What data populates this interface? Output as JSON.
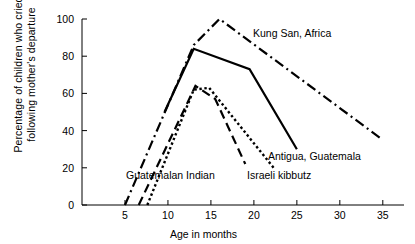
{
  "chart_data": {
    "type": "line",
    "title": "",
    "xlabel": "Age in months",
    "ylabel": "Percentage of children who cried following mother's departure",
    "ylabel_line1": "Percentage of children who cried",
    "ylabel_line2": "following mother's departure",
    "xlim": [
      0,
      37
    ],
    "ylim": [
      0,
      100
    ],
    "xticks": [
      5,
      10,
      15,
      20,
      25,
      30,
      35
    ],
    "yticks": [
      0,
      20,
      40,
      60,
      80,
      100
    ],
    "grid": false,
    "legend_position": "inline-annotations",
    "line_color": "#000000",
    "series": [
      {
        "name": "Kung San, Africa",
        "style": "dash-dot",
        "label_x": 27.0,
        "label_y": 95,
        "x": [
          5,
          13,
          16,
          35
        ],
        "y": [
          0,
          86,
          100,
          35
        ]
      },
      {
        "name": "Antigua, Guatemala",
        "style": "solid",
        "label_x": 28.5,
        "label_y": 30,
        "x": [
          9.6,
          13,
          19.5,
          25
        ],
        "y": [
          50,
          84,
          73,
          30
        ]
      },
      {
        "name": "Guatemalan Indian",
        "style": "dashed",
        "label_x": 12.5,
        "label_y": 18,
        "x": [
          6.6,
          13.2,
          15.5,
          19.0
        ],
        "y": [
          0,
          64,
          57,
          22
        ]
      },
      {
        "name": "Israeli kibbutz",
        "style": "dotted",
        "label_x": 22.0,
        "label_y": 16,
        "x": [
          7.6,
          13.0,
          14.8,
          22.3
        ],
        "y": [
          0,
          62,
          63,
          20
        ]
      }
    ]
  }
}
